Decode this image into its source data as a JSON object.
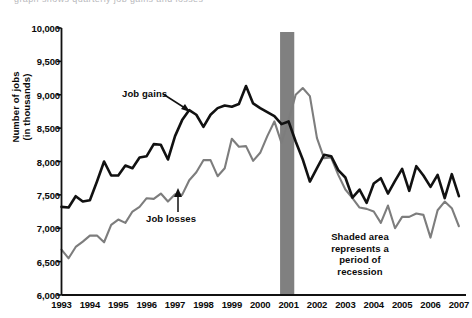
{
  "figure": {
    "top_bleed_text": "graph shows quarterly job gains and losses",
    "background": "#ffffff"
  },
  "annotations": {
    "job_gains": "Job gains",
    "job_losses": "Job losses",
    "recession_note_line1": "Shaded area",
    "recession_note_line2": "represents a",
    "recession_note_line3": "period of",
    "recession_note_line4": "recession"
  },
  "colors": {
    "job_gains_line": "#111111",
    "job_losses_line": "#7d7d7d",
    "recession_band": "#808080",
    "axis": "#111111",
    "text": "#0a0a0a"
  },
  "chart_data": {
    "type": "line",
    "title": "",
    "xlabel": "",
    "ylabel": "Number of jobs (in thousands)",
    "ylim": [
      6000,
      10000
    ],
    "ytick_values": [
      6000,
      6500,
      7000,
      7500,
      8000,
      8500,
      9000,
      9500,
      10000
    ],
    "ytick_labels": [
      "6,000",
      "6,500",
      "7,000",
      "7,500",
      "8,000",
      "8,500",
      "9,000",
      "9,500",
      "10,000"
    ],
    "xlim": [
      1993,
      2007.25
    ],
    "xtick_values": [
      1993,
      1994,
      1995,
      1996,
      1997,
      1998,
      1999,
      2000,
      2001,
      2002,
      2003,
      2004,
      2005,
      2006,
      2007
    ],
    "xtick_labels": [
      "1993",
      "1994",
      "1995",
      "1996",
      "1997",
      "1998",
      "1999",
      "2000",
      "2001",
      "2002",
      "2003",
      "2004",
      "2005",
      "2006",
      "2007"
    ],
    "grid": false,
    "legend": "annotated inline",
    "x": [
      1993.0,
      1993.25,
      1993.5,
      1993.75,
      1994.0,
      1994.25,
      1994.5,
      1994.75,
      1995.0,
      1995.25,
      1995.5,
      1995.75,
      1996.0,
      1996.25,
      1996.5,
      1996.75,
      1997.0,
      1997.25,
      1997.5,
      1997.75,
      1998.0,
      1998.25,
      1998.5,
      1998.75,
      1999.0,
      1999.25,
      1999.5,
      1999.75,
      2000.0,
      2000.25,
      2000.5,
      2000.75,
      2001.0,
      2001.25,
      2001.5,
      2001.75,
      2002.0,
      2002.25,
      2002.5,
      2002.75,
      2003.0,
      2003.25,
      2003.5,
      2003.75,
      2004.0,
      2004.25,
      2004.5,
      2004.75,
      2005.0,
      2005.25,
      2005.5,
      2005.75,
      2006.0,
      2006.25,
      2006.5,
      2006.75,
      2007.0
    ],
    "series": [
      {
        "name": "Job gains",
        "color": "#111111",
        "values": [
          7320,
          7310,
          7480,
          7400,
          7420,
          7700,
          8000,
          7790,
          7790,
          7940,
          7900,
          8060,
          8080,
          8260,
          8250,
          8030,
          8380,
          8620,
          8770,
          8700,
          8520,
          8700,
          8800,
          8840,
          8820,
          8860,
          9130,
          8870,
          8800,
          8740,
          8680,
          8560,
          8600,
          8300,
          8030,
          7700,
          7900,
          8100,
          8080,
          7870,
          7760,
          7460,
          7580,
          7380,
          7670,
          7750,
          7520,
          7710,
          7890,
          7560,
          7930,
          7790,
          7620,
          7800,
          7450,
          7810,
          7480
        ]
      },
      {
        "name": "Job losses",
        "color": "#7d7d7d",
        "values": [
          6680,
          6550,
          6720,
          6800,
          6890,
          6890,
          6790,
          7050,
          7130,
          7080,
          7250,
          7320,
          7450,
          7440,
          7520,
          7400,
          7510,
          7500,
          7720,
          7840,
          8020,
          8020,
          7780,
          7900,
          8340,
          8220,
          8230,
          8010,
          8130,
          8380,
          8600,
          8280,
          8620,
          9000,
          9100,
          8980,
          8350,
          8050,
          8060,
          7800,
          7580,
          7450,
          7310,
          7290,
          7250,
          7080,
          7340,
          7000,
          7170,
          7170,
          7220,
          7200,
          6860,
          7270,
          7400,
          7300,
          7030
        ]
      }
    ],
    "shaded_regions": [
      {
        "label": "period of recession",
        "x_start": 2000.7,
        "x_end": 2001.2,
        "color": "#808080"
      }
    ]
  }
}
